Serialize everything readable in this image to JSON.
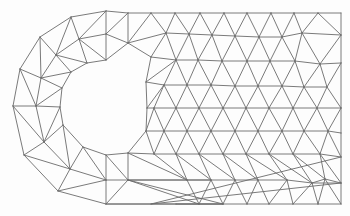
{
  "figure": {
    "stroke_color": "#6b6b6b",
    "background_color": "#fdfdfd"
  },
  "mesh": {
    "nodes": [
      [
        106,
        11
      ],
      [
        71,
        17
      ],
      [
        40,
        37
      ],
      [
        20,
        69
      ],
      [
        13,
        106
      ],
      [
        24,
        155
      ],
      [
        58,
        191
      ],
      [
        106,
        204
      ],
      [
        106,
        60
      ],
      [
        87,
        63
      ],
      [
        71,
        72
      ],
      [
        62,
        88
      ],
      [
        60,
        107
      ],
      [
        63,
        125
      ],
      [
        83,
        147
      ],
      [
        106,
        155
      ],
      [
        128,
        153
      ],
      [
        146,
        131
      ],
      [
        147,
        108
      ],
      [
        146,
        82
      ],
      [
        151,
        57
      ],
      [
        128,
        43
      ],
      [
        79,
        39
      ],
      [
        106,
        34
      ],
      [
        56,
        55
      ],
      [
        41,
        78
      ],
      [
        36,
        106
      ],
      [
        44,
        142
      ],
      [
        70,
        169
      ],
      [
        106,
        180
      ],
      [
        128,
        180
      ],
      [
        128,
        13
      ],
      [
        151,
        13
      ],
      [
        175,
        13
      ],
      [
        200,
        13
      ],
      [
        224,
        13
      ],
      [
        247,
        13
      ],
      [
        271,
        13
      ],
      [
        294,
        13
      ],
      [
        318,
        13
      ],
      [
        341,
        13
      ],
      [
        166,
        33
      ],
      [
        189,
        34
      ],
      [
        212,
        35
      ],
      [
        235,
        36
      ],
      [
        259,
        37
      ],
      [
        282,
        37
      ],
      [
        302,
        33
      ],
      [
        341,
        35
      ],
      [
        176,
        60
      ],
      [
        198,
        60
      ],
      [
        222,
        61
      ],
      [
        247,
        61
      ],
      [
        270,
        61
      ],
      [
        295,
        61
      ],
      [
        320,
        64
      ],
      [
        341,
        63
      ],
      [
        164,
        85
      ],
      [
        187,
        85
      ],
      [
        211,
        85
      ],
      [
        235,
        86
      ],
      [
        258,
        86
      ],
      [
        282,
        86
      ],
      [
        304,
        87
      ],
      [
        327,
        87
      ],
      [
        154,
        108
      ],
      [
        176,
        108
      ],
      [
        199,
        108
      ],
      [
        223,
        108
      ],
      [
        246,
        108
      ],
      [
        269,
        108
      ],
      [
        293,
        108
      ],
      [
        317,
        108
      ],
      [
        341,
        108
      ],
      [
        164,
        131
      ],
      [
        187,
        131
      ],
      [
        211,
        131
      ],
      [
        235,
        131
      ],
      [
        258,
        131
      ],
      [
        282,
        131
      ],
      [
        304,
        131
      ],
      [
        328,
        131
      ],
      [
        341,
        133
      ],
      [
        154,
        154
      ],
      [
        176,
        154
      ],
      [
        199,
        154
      ],
      [
        223,
        154
      ],
      [
        246,
        154
      ],
      [
        269,
        154
      ],
      [
        293,
        154
      ],
      [
        320,
        154
      ],
      [
        341,
        157
      ],
      [
        164,
        180
      ],
      [
        187,
        180
      ],
      [
        211,
        180
      ],
      [
        235,
        180
      ],
      [
        258,
        180
      ],
      [
        287,
        180
      ],
      [
        312,
        183
      ],
      [
        325,
        179
      ],
      [
        341,
        183
      ],
      [
        151,
        204
      ],
      [
        176,
        204
      ],
      [
        199,
        204
      ],
      [
        223,
        204
      ],
      [
        247,
        204
      ],
      [
        269,
        204
      ],
      [
        293,
        204
      ],
      [
        318,
        204
      ],
      [
        341,
        204
      ]
    ],
    "edges": [
      [
        0,
        1
      ],
      [
        1,
        2
      ],
      [
        2,
        3
      ],
      [
        3,
        4
      ],
      [
        4,
        5
      ],
      [
        5,
        6
      ],
      [
        6,
        7
      ],
      [
        8,
        9
      ],
      [
        9,
        10
      ],
      [
        10,
        11
      ],
      [
        11,
        12
      ],
      [
        12,
        13
      ],
      [
        13,
        14
      ],
      [
        14,
        15
      ],
      [
        15,
        16
      ],
      [
        16,
        17
      ],
      [
        17,
        18
      ],
      [
        18,
        19
      ],
      [
        19,
        20
      ],
      [
        20,
        21
      ],
      [
        21,
        8
      ],
      [
        0,
        31
      ],
      [
        7,
        104
      ],
      [
        0,
        23
      ],
      [
        23,
        8
      ],
      [
        1,
        22
      ],
      [
        22,
        23
      ],
      [
        22,
        0
      ],
      [
        22,
        9
      ],
      [
        22,
        8
      ],
      [
        2,
        24
      ],
      [
        24,
        22
      ],
      [
        24,
        1
      ],
      [
        24,
        10
      ],
      [
        24,
        9
      ],
      [
        3,
        25
      ],
      [
        25,
        24
      ],
      [
        25,
        2
      ],
      [
        25,
        11
      ],
      [
        25,
        10
      ],
      [
        4,
        26
      ],
      [
        26,
        25
      ],
      [
        26,
        3
      ],
      [
        26,
        12
      ],
      [
        26,
        11
      ],
      [
        5,
        27
      ],
      [
        27,
        26
      ],
      [
        27,
        4
      ],
      [
        27,
        13
      ],
      [
        27,
        12
      ],
      [
        6,
        28
      ],
      [
        28,
        27
      ],
      [
        28,
        5
      ],
      [
        28,
        14
      ],
      [
        28,
        13
      ],
      [
        7,
        29
      ],
      [
        29,
        28
      ],
      [
        29,
        6
      ],
      [
        29,
        15
      ],
      [
        29,
        14
      ],
      [
        29,
        30
      ],
      [
        30,
        7
      ],
      [
        30,
        15
      ],
      [
        30,
        16
      ],
      [
        30,
        104
      ],
      [
        30,
        94
      ],
      [
        23,
        21
      ],
      [
        21,
        31
      ],
      [
        31,
        23
      ],
      [
        21,
        32
      ],
      [
        21,
        41
      ],
      [
        21,
        20
      ],
      [
        20,
        41
      ],
      [
        41,
        32
      ],
      [
        41,
        33
      ],
      [
        41,
        42
      ],
      [
        42,
        33
      ],
      [
        42,
        34
      ],
      [
        42,
        43
      ],
      [
        43,
        34
      ],
      [
        43,
        35
      ],
      [
        43,
        44
      ],
      [
        44,
        35
      ],
      [
        44,
        36
      ],
      [
        44,
        45
      ],
      [
        45,
        36
      ],
      [
        45,
        37
      ],
      [
        45,
        46
      ],
      [
        46,
        37
      ],
      [
        46,
        38
      ],
      [
        46,
        47
      ],
      [
        47,
        38
      ],
      [
        47,
        39
      ],
      [
        47,
        48
      ],
      [
        48,
        39
      ],
      [
        48,
        40
      ],
      [
        31,
        32
      ],
      [
        32,
        33
      ],
      [
        33,
        34
      ],
      [
        34,
        35
      ],
      [
        35,
        36
      ],
      [
        36,
        37
      ],
      [
        37,
        38
      ],
      [
        38,
        39
      ],
      [
        39,
        40
      ],
      [
        40,
        48
      ],
      [
        20,
        49
      ],
      [
        41,
        49
      ],
      [
        49,
        42
      ],
      [
        42,
        50
      ],
      [
        49,
        50
      ],
      [
        50,
        43
      ],
      [
        43,
        51
      ],
      [
        50,
        51
      ],
      [
        51,
        44
      ],
      [
        44,
        52
      ],
      [
        51,
        52
      ],
      [
        52,
        45
      ],
      [
        45,
        53
      ],
      [
        52,
        53
      ],
      [
        53,
        46
      ],
      [
        46,
        54
      ],
      [
        53,
        54
      ],
      [
        54,
        47
      ],
      [
        47,
        55
      ],
      [
        54,
        55
      ],
      [
        55,
        48
      ],
      [
        48,
        56
      ],
      [
        55,
        56
      ],
      [
        19,
        20
      ],
      [
        19,
        49
      ],
      [
        19,
        57
      ],
      [
        57,
        49
      ],
      [
        57,
        58
      ],
      [
        49,
        58
      ],
      [
        58,
        50
      ],
      [
        58,
        59
      ],
      [
        50,
        59
      ],
      [
        59,
        51
      ],
      [
        59,
        60
      ],
      [
        51,
        60
      ],
      [
        60,
        52
      ],
      [
        60,
        61
      ],
      [
        52,
        61
      ],
      [
        61,
        53
      ],
      [
        61,
        62
      ],
      [
        53,
        62
      ],
      [
        62,
        54
      ],
      [
        62,
        63
      ],
      [
        54,
        63
      ],
      [
        63,
        55
      ],
      [
        63,
        64
      ],
      [
        55,
        64
      ],
      [
        64,
        56
      ],
      [
        56,
        73
      ],
      [
        64,
        73
      ],
      [
        18,
        19
      ],
      [
        18,
        57
      ],
      [
        18,
        65
      ],
      [
        65,
        57
      ],
      [
        65,
        66
      ],
      [
        57,
        66
      ],
      [
        66,
        58
      ],
      [
        66,
        67
      ],
      [
        58,
        67
      ],
      [
        67,
        59
      ],
      [
        67,
        68
      ],
      [
        59,
        68
      ],
      [
        68,
        60
      ],
      [
        68,
        69
      ],
      [
        60,
        69
      ],
      [
        69,
        61
      ],
      [
        69,
        70
      ],
      [
        61,
        70
      ],
      [
        70,
        62
      ],
      [
        70,
        71
      ],
      [
        62,
        71
      ],
      [
        71,
        63
      ],
      [
        71,
        72
      ],
      [
        63,
        72
      ],
      [
        72,
        64
      ],
      [
        72,
        73
      ],
      [
        17,
        18
      ],
      [
        17,
        65
      ],
      [
        17,
        74
      ],
      [
        65,
        74
      ],
      [
        74,
        66
      ],
      [
        74,
        75
      ],
      [
        66,
        75
      ],
      [
        75,
        67
      ],
      [
        75,
        76
      ],
      [
        67,
        76
      ],
      [
        76,
        68
      ],
      [
        76,
        77
      ],
      [
        68,
        77
      ],
      [
        77,
        69
      ],
      [
        77,
        78
      ],
      [
        69,
        78
      ],
      [
        78,
        70
      ],
      [
        78,
        79
      ],
      [
        70,
        79
      ],
      [
        79,
        71
      ],
      [
        79,
        80
      ],
      [
        71,
        80
      ],
      [
        80,
        72
      ],
      [
        80,
        81
      ],
      [
        72,
        81
      ],
      [
        81,
        73
      ],
      [
        73,
        82
      ],
      [
        81,
        82
      ],
      [
        17,
        83
      ],
      [
        74,
        83
      ],
      [
        83,
        84
      ],
      [
        74,
        84
      ],
      [
        84,
        75
      ],
      [
        84,
        85
      ],
      [
        75,
        85
      ],
      [
        85,
        76
      ],
      [
        85,
        86
      ],
      [
        76,
        86
      ],
      [
        86,
        77
      ],
      [
        86,
        87
      ],
      [
        77,
        87
      ],
      [
        87,
        78
      ],
      [
        87,
        88
      ],
      [
        78,
        88
      ],
      [
        88,
        79
      ],
      [
        88,
        89
      ],
      [
        79,
        89
      ],
      [
        89,
        80
      ],
      [
        89,
        90
      ],
      [
        80,
        90
      ],
      [
        90,
        81
      ],
      [
        90,
        91
      ],
      [
        81,
        91
      ],
      [
        91,
        82
      ],
      [
        16,
        17
      ],
      [
        16,
        83
      ],
      [
        16,
        93
      ],
      [
        83,
        93
      ],
      [
        93,
        84
      ],
      [
        93,
        94
      ],
      [
        84,
        94
      ],
      [
        94,
        85
      ],
      [
        94,
        95
      ],
      [
        85,
        95
      ],
      [
        95,
        86
      ],
      [
        95,
        96
      ],
      [
        86,
        96
      ],
      [
        96,
        87
      ],
      [
        96,
        97
      ],
      [
        87,
        97
      ],
      [
        97,
        88
      ],
      [
        97,
        98
      ],
      [
        88,
        98
      ],
      [
        98,
        89
      ],
      [
        98,
        99
      ],
      [
        89,
        99
      ],
      [
        99,
        90
      ],
      [
        90,
        100
      ],
      [
        99,
        100
      ],
      [
        100,
        91
      ],
      [
        91,
        101
      ],
      [
        100,
        101
      ],
      [
        98,
        100
      ],
      [
        16,
        30
      ],
      [
        30,
        93
      ],
      [
        93,
        103
      ],
      [
        30,
        103
      ],
      [
        103,
        94
      ],
      [
        103,
        104
      ],
      [
        94,
        104
      ],
      [
        104,
        95
      ],
      [
        104,
        105
      ],
      [
        95,
        105
      ],
      [
        105,
        96
      ],
      [
        105,
        106
      ],
      [
        96,
        106
      ],
      [
        106,
        97
      ],
      [
        106,
        107
      ],
      [
        97,
        107
      ],
      [
        107,
        98
      ],
      [
        107,
        108
      ],
      [
        98,
        108
      ],
      [
        108,
        99
      ],
      [
        108,
        109
      ],
      [
        99,
        109
      ],
      [
        109,
        100
      ],
      [
        109,
        110
      ],
      [
        100,
        110
      ],
      [
        110,
        101
      ],
      [
        104,
        7
      ],
      [
        103,
        102
      ],
      [
        102,
        104
      ],
      [
        7,
        102
      ]
    ]
  }
}
